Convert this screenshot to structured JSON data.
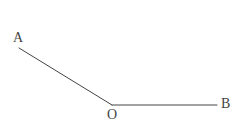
{
  "figure": {
    "type": "geometry-diagram",
    "background_color": "#ffffff",
    "stroke_color": "#444444",
    "stroke_width": 1,
    "width": 240,
    "height": 125,
    "points": {
      "A": {
        "x": 19,
        "y": 48,
        "label": "A",
        "label_x": 13,
        "label_y": 31
      },
      "O": {
        "x": 112,
        "y": 105,
        "label": "O",
        "label_x": 107,
        "label_y": 108
      },
      "B": {
        "x": 217,
        "y": 105,
        "label": "B",
        "label_x": 221,
        "label_y": 97
      }
    },
    "segments": [
      {
        "name": "ray-OA",
        "from": "O",
        "to": "A",
        "x1": 112,
        "y1": 105,
        "x2": 19,
        "y2": 48
      },
      {
        "name": "ray-OB",
        "from": "O",
        "to": "B",
        "x1": 112,
        "y1": 105,
        "x2": 217,
        "y2": 105
      }
    ],
    "labels": {
      "A": "A",
      "O": "O",
      "B": "B"
    }
  }
}
